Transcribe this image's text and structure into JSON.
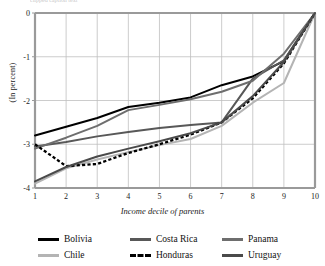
{
  "top_caption": "clipped caption text",
  "axes": {
    "ylabel": "(In percent)",
    "xlabel": "Income decile of parents",
    "yticks": [
      "0",
      "-1",
      "-2",
      "-3",
      "-4"
    ],
    "xticks": [
      "1",
      "2",
      "3",
      "4",
      "5",
      "6",
      "7",
      "8",
      "9",
      "10"
    ]
  },
  "legend": {
    "items": [
      {
        "label": "Bolivia",
        "color": "#000000",
        "style": "solid"
      },
      {
        "label": "Costa Rica",
        "color": "#585858",
        "style": "solid"
      },
      {
        "label": "Panama",
        "color": "#6e6e6e",
        "style": "solid"
      },
      {
        "label": "Chile",
        "color": "#b4b4b4",
        "style": "solid"
      },
      {
        "label": "Honduras",
        "color": "#000000",
        "style": "dashed"
      },
      {
        "label": "Uruguay",
        "color": "#4a4a4a",
        "style": "solid"
      }
    ]
  },
  "chart_data": {
    "type": "line",
    "title": "",
    "xlabel": "Income decile of parents",
    "ylabel": "(In percent)",
    "x": [
      1,
      2,
      3,
      4,
      5,
      6,
      7,
      8,
      9,
      10
    ],
    "xlim": [
      1,
      10
    ],
    "ylim": [
      -4,
      0
    ],
    "grid": true,
    "legend_position": "bottom",
    "series": [
      {
        "name": "Bolivia",
        "color": "#000000",
        "style": "solid",
        "values": [
          -2.8,
          -2.6,
          -2.4,
          -2.15,
          -2.05,
          -1.93,
          -1.65,
          -1.45,
          -1.1,
          0.0
        ]
      },
      {
        "name": "Costa Rica",
        "color": "#585858",
        "style": "solid",
        "values": [
          -3.05,
          -2.95,
          -2.82,
          -2.72,
          -2.63,
          -2.56,
          -2.5,
          -1.5,
          -1.08,
          0.0
        ]
      },
      {
        "name": "Panama",
        "color": "#6e6e6e",
        "style": "solid",
        "values": [
          -3.1,
          -2.85,
          -2.58,
          -2.22,
          -2.1,
          -1.97,
          -1.8,
          -1.55,
          -0.93,
          0.0
        ]
      },
      {
        "name": "Chile",
        "color": "#b4b4b4",
        "style": "solid",
        "values": [
          -3.9,
          -3.55,
          -3.35,
          -3.18,
          -3.02,
          -2.88,
          -2.58,
          -2.05,
          -1.6,
          0.0
        ]
      },
      {
        "name": "Honduras",
        "color": "#000000",
        "style": "dashed",
        "values": [
          -3.0,
          -3.5,
          -3.45,
          -3.2,
          -3.0,
          -2.78,
          -2.5,
          -1.95,
          -1.15,
          0.0
        ]
      },
      {
        "name": "Uruguay",
        "color": "#4a4a4a",
        "style": "solid",
        "values": [
          -3.85,
          -3.52,
          -3.28,
          -3.1,
          -2.93,
          -2.75,
          -2.5,
          -1.9,
          -1.12,
          0.0
        ]
      }
    ]
  }
}
